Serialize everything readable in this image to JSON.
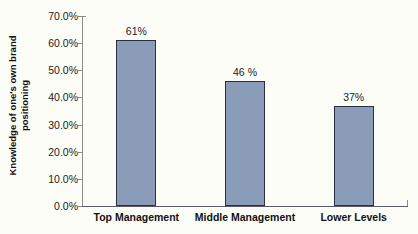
{
  "chart_data": {
    "type": "bar",
    "title": "",
    "xlabel": "",
    "ylabel": "Knowledge of one's own brand positioning",
    "ylabel_line1": "Knowledge of one's own brand",
    "ylabel_line2": "positioning",
    "categories": [
      "Top Management",
      "Middle Management",
      "Lower Levels"
    ],
    "values": [
      61,
      46,
      37
    ],
    "data_labels": [
      "61%",
      "46 %",
      "37%"
    ],
    "ylim": [
      0,
      70
    ],
    "ytick_values": [
      70,
      60,
      50,
      40,
      30,
      20,
      10,
      0
    ],
    "ytick_labels": [
      "70.0%",
      "60.0%",
      "50.0%",
      "40.0%",
      "30.0%",
      "20.0%",
      "10.0%",
      "0.0%"
    ],
    "grid": false,
    "legend": false,
    "bar_color": "#8a9cb8",
    "bar_border_color": "#2b3040",
    "background_color": "#fdfdf8",
    "axis_color": "#8c8c8c"
  }
}
